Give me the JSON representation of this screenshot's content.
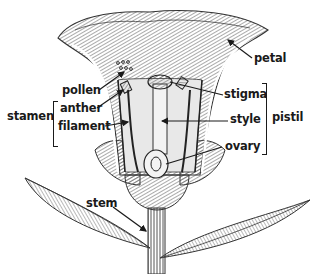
{
  "diagram": {
    "colors": {
      "ink": "#1a1a1a",
      "hatch": "#555555",
      "background": "#ffffff"
    },
    "labels": {
      "petal": "petal",
      "pollen": "pollen",
      "stamen": "stamen",
      "anther": "anther",
      "filament": "filament",
      "stigma": "stigma",
      "style": "style",
      "pistil": "pistil",
      "ovary": "ovary",
      "stem": "stem"
    },
    "groups": [
      {
        "name": "stamen",
        "members": [
          "anther",
          "filament"
        ]
      },
      {
        "name": "pistil",
        "members": [
          "stigma",
          "style",
          "ovary"
        ]
      }
    ]
  }
}
